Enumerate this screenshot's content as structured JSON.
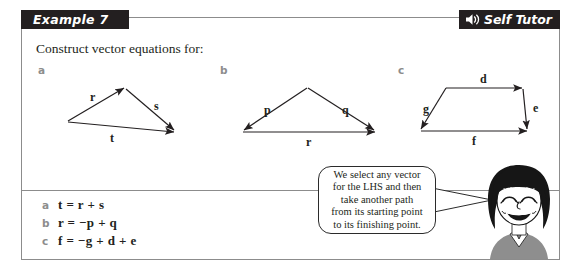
{
  "header": {
    "example_label": "Example 7",
    "self_tutor_label": "Self Tutor",
    "speaker_icon_name": "speaker-icon",
    "bar_color": "#231f20",
    "text_color": "#ffffff"
  },
  "question": {
    "prompt": "Construct vector equations for:",
    "parts": [
      {
        "letter": "a",
        "labels": [
          "r",
          "s",
          "t"
        ]
      },
      {
        "letter": "b",
        "labels": [
          "p",
          "q",
          "r"
        ]
      },
      {
        "letter": "c",
        "labels": [
          "d",
          "e",
          "f",
          "g"
        ]
      }
    ],
    "diagram_a": {
      "r": "r",
      "s": "s",
      "t": "t"
    },
    "diagram_b": {
      "p": "p",
      "q": "q",
      "r": "r"
    },
    "diagram_c": {
      "d": "d",
      "e": "e",
      "f": "f",
      "g": "g"
    }
  },
  "answers": [
    {
      "key": "a",
      "equation": "t = r + s"
    },
    {
      "key": "b",
      "equation": "r = −p + q"
    },
    {
      "key": "c",
      "equation": "f = −g + d + e"
    }
  ],
  "speech_bubble": {
    "lines": [
      "We select any vector",
      "for the LHS and then",
      "take another path",
      "from its starting point",
      "to its finishing point."
    ]
  },
  "character": {
    "name": "cartoon-girl",
    "hair_color": "#161616",
    "shirt_color": "#8e8e8e",
    "skin_color": "#ffffff"
  },
  "colors": {
    "ink": "#231f20",
    "frame": "#8c8c8c",
    "part_letter": "#8d8d8d"
  }
}
